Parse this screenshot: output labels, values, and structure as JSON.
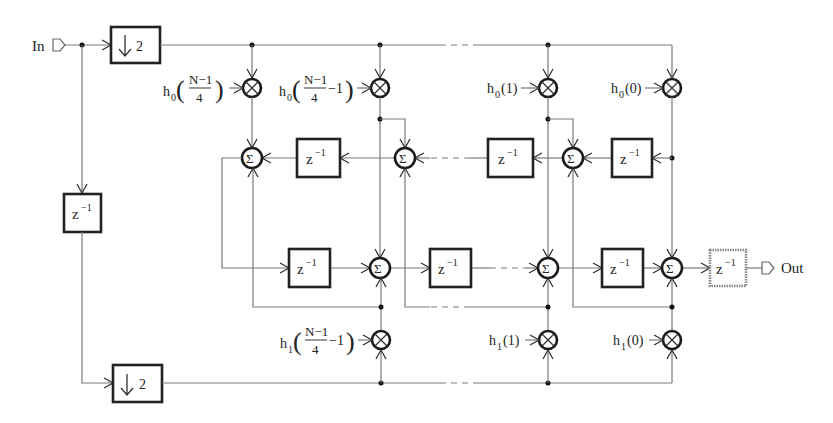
{
  "diagram": {
    "type": "polyphase FIR filter block diagram",
    "input_label": "In",
    "output_label": "Out",
    "downsampler_label": "2",
    "delay_label_base": "z",
    "delay_label_exp": "−1",
    "sum_symbol": "Σ",
    "multiply_symbol": "⊗",
    "top_coefficients": [
      {
        "name": "h",
        "sub": "0",
        "arg_num": "N−1",
        "arg_den": "4",
        "arg_suffix": ""
      },
      {
        "name": "h",
        "sub": "0",
        "arg_num": "N−1",
        "arg_den": "4",
        "arg_suffix": "−1"
      },
      {
        "name": "h",
        "sub": "0",
        "arg": "(1)"
      },
      {
        "name": "h",
        "sub": "0",
        "arg": "(0)"
      }
    ],
    "bottom_coefficients": [
      {
        "name": "h",
        "sub": "1",
        "arg_num": "N−1",
        "arg_den": "4",
        "arg_suffix": "−1"
      },
      {
        "name": "h",
        "sub": "1",
        "arg": "(1)"
      },
      {
        "name": "h",
        "sub": "1",
        "arg": "(0)"
      }
    ]
  }
}
